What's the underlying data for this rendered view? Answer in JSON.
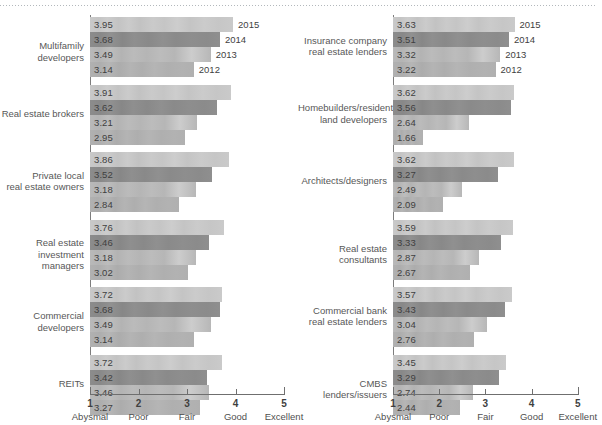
{
  "chart_data": {
    "type": "bar",
    "orientation": "horizontal",
    "title": "",
    "xlabel": "",
    "ylabel": "",
    "xlim": [
      1,
      5
    ],
    "grid": false,
    "legend_position": "inline-year-labels",
    "series": [
      {
        "name": "2015",
        "color": "#c8c8c8"
      },
      {
        "name": "2014",
        "color": "#8c8c8c"
      },
      {
        "name": "2013",
        "color": "#b9b9b9"
      },
      {
        "name": "2012",
        "color": "#b1b1b1"
      }
    ],
    "axis_ticks": [
      {
        "value": 1,
        "number": "1",
        "word": "Abysmal"
      },
      {
        "value": 2,
        "number": "2",
        "word": "Poor"
      },
      {
        "value": 3,
        "number": "3",
        "word": "Fair"
      },
      {
        "value": 4,
        "number": "4",
        "word": "Good"
      },
      {
        "value": 5,
        "number": "5",
        "word": "Excellent"
      }
    ],
    "panels": [
      {
        "id": "left",
        "categories": [
          {
            "label": "Multifamily developers",
            "values": {
              "2015": 3.95,
              "2014": 3.68,
              "2013": 3.49,
              "2012": 3.14
            }
          },
          {
            "label": "Real estate brokers",
            "values": {
              "2015": 3.91,
              "2014": 3.62,
              "2013": 3.21,
              "2012": 2.95
            }
          },
          {
            "label": "Private local\nreal estate owners",
            "values": {
              "2015": 3.86,
              "2014": 3.52,
              "2013": 3.18,
              "2012": 2.84
            }
          },
          {
            "label": "Real estate\ninvestment managers",
            "values": {
              "2015": 3.76,
              "2014": 3.46,
              "2013": 3.18,
              "2012": 3.02
            }
          },
          {
            "label": "Commercial developers",
            "values": {
              "2015": 3.72,
              "2014": 3.68,
              "2013": 3.49,
              "2012": 3.14
            }
          },
          {
            "label": "REITs",
            "values": {
              "2015": 3.72,
              "2014": 3.42,
              "2013": 3.46,
              "2012": 3.27
            }
          }
        ]
      },
      {
        "id": "right",
        "categories": [
          {
            "label": "Insurance company\nreal estate lenders",
            "values": {
              "2015": 3.63,
              "2014": 3.51,
              "2013": 3.32,
              "2012": 3.22
            }
          },
          {
            "label": "Homebuilders/residential\nland developers",
            "values": {
              "2015": 3.62,
              "2014": 3.56,
              "2013": 2.64,
              "2012": 1.66
            }
          },
          {
            "label": "Architects/designers",
            "values": {
              "2015": 3.62,
              "2014": 3.27,
              "2013": 2.49,
              "2012": 2.09
            }
          },
          {
            "label": "Real estate consultants",
            "values": {
              "2015": 3.59,
              "2014": 3.33,
              "2013": 2.87,
              "2012": 2.67
            }
          },
          {
            "label": "Commercial bank\nreal estate lenders",
            "values": {
              "2015": 3.57,
              "2014": 3.43,
              "2013": 3.04,
              "2012": 2.76
            }
          },
          {
            "label": "CMBS lenders/issuers",
            "values": {
              "2015": 3.45,
              "2014": 3.29,
              "2013": 2.74,
              "2012": 2.44
            }
          }
        ]
      }
    ],
    "year_callouts": [
      "2015",
      "2014",
      "2013",
      "2012"
    ]
  }
}
